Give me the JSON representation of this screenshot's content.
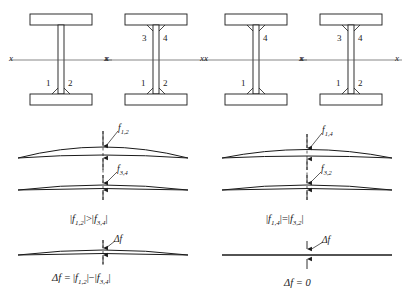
{
  "figure": {
    "stroke_color": "#1a1a1a",
    "axis_color": "#555555",
    "flange_fill": "#ffffff"
  },
  "beams": [
    {
      "id": "beam-1",
      "welds": [
        {
          "label": "1",
          "position": "bottom-left"
        },
        {
          "label": "2",
          "position": "bottom-right"
        }
      ],
      "axis_left": "x",
      "axis_right": "x"
    },
    {
      "id": "beam-2",
      "welds": [
        {
          "label": "3",
          "position": "top-left"
        },
        {
          "label": "4",
          "position": "top-right"
        },
        {
          "label": "1",
          "position": "bottom-left"
        },
        {
          "label": "2",
          "position": "bottom-right"
        }
      ],
      "axis_left": "x",
      "axis_right": "x"
    },
    {
      "id": "beam-3",
      "welds": [
        {
          "label": "4",
          "position": "top-right"
        },
        {
          "label": "1",
          "position": "bottom-left"
        }
      ],
      "axis_left": "x",
      "axis_right": "x"
    },
    {
      "id": "beam-4",
      "welds": [
        {
          "label": "3",
          "position": "top-left"
        },
        {
          "label": "4",
          "position": "top-right"
        },
        {
          "label": "1",
          "position": "bottom-left"
        },
        {
          "label": "2",
          "position": "bottom-right"
        }
      ],
      "axis_left": "x",
      "axis_right": "x"
    }
  ],
  "left_panel": {
    "curve_upper_label": "f",
    "curve_upper_sub": "1,2",
    "curve_lower_label": "f",
    "curve_lower_sub": "3,4",
    "comparison": {
      "lhs_sym": "f",
      "lhs_sub": "1,2",
      "operator": ">",
      "rhs_sym": "f",
      "rhs_sub": "3,4"
    },
    "result_curve_label": "Δf",
    "result_formula": {
      "lead": "Δf =",
      "lhs_sym": "f",
      "lhs_sub": "1,2",
      "operator": "−",
      "rhs_sym": "f",
      "rhs_sub": "3,4"
    }
  },
  "right_panel": {
    "curve_upper_label": "f",
    "curve_upper_sub": "1,4",
    "curve_lower_label": "f",
    "curve_lower_sub": "3,2",
    "comparison": {
      "lhs_sym": "f",
      "lhs_sub": "1,4",
      "operator": "=",
      "rhs_sym": "f",
      "rhs_sub": "3,2"
    },
    "result_curve_label": "Δf",
    "result_formula_flat": "Δf = 0"
  }
}
